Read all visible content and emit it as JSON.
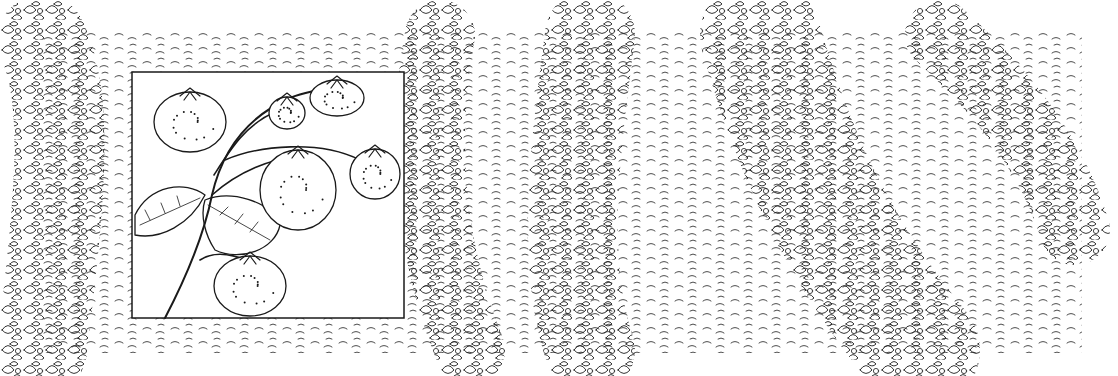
{
  "image": {
    "kind": "pen-and-ink illustration",
    "subject": "strawberry field rows with inset strawberry plant",
    "background_color": "#ffffff",
    "ink_color": "#1a1a1a"
  },
  "field": {
    "bounds": {
      "x": 42,
      "y": 33,
      "width": 1040,
      "height": 320
    },
    "rows": [
      {
        "name": "row-left",
        "path": "M42,40 C70,100 60,200 42,350",
        "width": 90
      },
      {
        "name": "row-second",
        "path": "M440,35 C420,140 430,250 470,350",
        "width": 70
      },
      {
        "name": "row-third",
        "path": "M590,35 C575,150 560,260 590,350",
        "width": 90
      },
      {
        "name": "row-fourth",
        "path": "M760,35 C790,140 830,240 920,350",
        "width": 120
      },
      {
        "name": "row-fifth",
        "path": "M940,35 C1000,90 1050,150 1075,230",
        "width": 70
      }
    ]
  },
  "inset": {
    "bounds": {
      "x": 132,
      "y": 72,
      "width": 272,
      "height": 246
    },
    "berries": [
      {
        "cx": 190,
        "cy": 122,
        "rx": 36,
        "ry": 30
      },
      {
        "cx": 287,
        "cy": 113,
        "rx": 18,
        "ry": 16
      },
      {
        "cx": 337,
        "cy": 98,
        "rx": 27,
        "ry": 18
      },
      {
        "cx": 298,
        "cy": 190,
        "rx": 38,
        "ry": 40
      },
      {
        "cx": 375,
        "cy": 174,
        "rx": 25,
        "ry": 25
      },
      {
        "cx": 250,
        "cy": 286,
        "rx": 36,
        "ry": 30
      }
    ]
  }
}
